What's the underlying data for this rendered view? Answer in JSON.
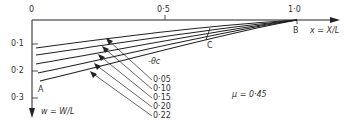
{
  "axes": {
    "origin_label": "0",
    "x_tick_mid": "0·5",
    "x_tick_end": "1·0",
    "x_axis_label": "x = X/L",
    "y_ticks": [
      "0·1",
      "0·2",
      "0·3"
    ],
    "y_axis_label": "w = W/L"
  },
  "points": {
    "A": "A",
    "B": "B",
    "C": "C"
  },
  "legend": {
    "title": "-θc",
    "curves": [
      "0·05",
      "0·10",
      "0·15",
      "0·20",
      "0·22"
    ]
  },
  "parameter": "μ = 0·45",
  "colors": {
    "line": "#222222",
    "background": "#ffffff"
  }
}
